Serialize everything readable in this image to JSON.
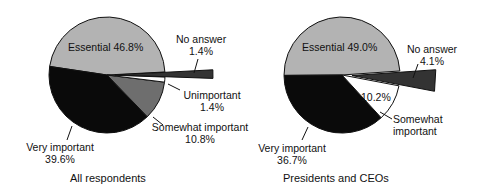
{
  "chart_data": [
    {
      "type": "pie",
      "title": "All respondents",
      "categories": [
        "Essential",
        "Very important",
        "Somewhat important",
        "Unimportant",
        "No answer"
      ],
      "values": [
        46.8,
        39.6,
        10.8,
        1.4,
        1.4
      ],
      "labels": [
        "Essential 46.8%",
        "Very important 39.6%",
        "Somewhat important 10.8%",
        "Unimportant 1.4%",
        "No answer 1.4%"
      ],
      "exploded": [
        "No answer"
      ],
      "colors": [
        "#b3b3b3",
        "#0a0a0a",
        "#6e6e6e",
        "#ffffff",
        "#333333"
      ]
    },
    {
      "type": "pie",
      "title": "Presidents and CEOs",
      "categories": [
        "Essential",
        "Very important",
        "Somewhat important",
        "No answer"
      ],
      "values": [
        49.0,
        36.7,
        10.2,
        4.1
      ],
      "labels": [
        "Essential 49.0%",
        "Very important 36.7%",
        "Somewhat important 10.2%",
        "No answer 4.1%"
      ],
      "exploded": [
        "No answer"
      ],
      "colors": [
        "#b3b3b3",
        "#0a0a0a",
        "#ffffff",
        "#333333"
      ]
    }
  ],
  "left": {
    "title": "All respondents",
    "essential": "Essential 46.8%",
    "no_answer_name": "No answer",
    "no_answer_value": "1.4%",
    "unimportant_name": "Unimportant",
    "unimportant_value": "1.4%",
    "somewhat_name": "Somewhat important",
    "somewhat_value": "10.8%",
    "very_name": "Very important",
    "very_value": "39.6%"
  },
  "right": {
    "title": "Presidents and CEOs",
    "essential": "Essential 49.0%",
    "no_answer_name": "No answer",
    "no_answer_value": "4.1%",
    "somewhat_value": "10.2%",
    "somewhat_name1": "Somewhat",
    "somewhat_name2": "important",
    "very_name": "Very important",
    "very_value": "36.7%"
  }
}
